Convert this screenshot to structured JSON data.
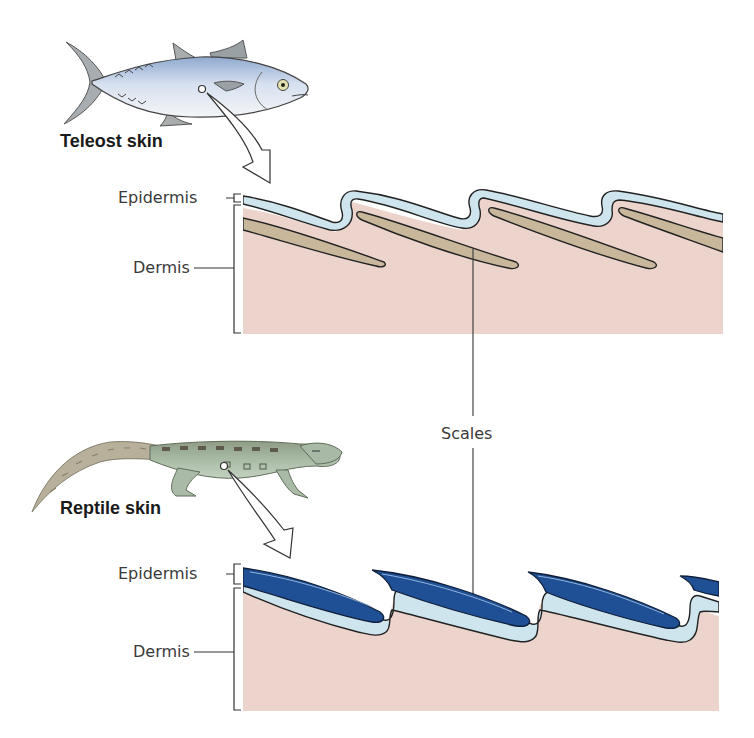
{
  "figure": {
    "teleost": {
      "title": "Teleost skin",
      "layers": {
        "epidermis": "Epidermis",
        "dermis": "Dermis"
      },
      "colors": {
        "epidermis": "#cfe5ee",
        "scale": "#c8b79a",
        "dermis": "#ecd4cd"
      }
    },
    "reptile": {
      "title": "Reptile skin",
      "layers": {
        "epidermis": "Epidermis",
        "dermis": "Dermis"
      },
      "colors": {
        "epidermis": "#cfe5ee",
        "scale": "#1f4f94",
        "dermis": "#ecd4cd"
      }
    },
    "shared_label": "Scales"
  }
}
